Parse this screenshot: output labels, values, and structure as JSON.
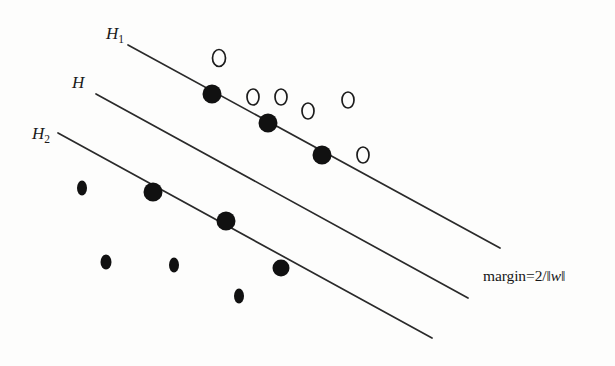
{
  "figure": {
    "background_color": "#fdfdfc",
    "ink_color": "#1a1a1a",
    "width": 615,
    "height": 366
  },
  "labels": {
    "h1": {
      "base": "H",
      "sub": "1"
    },
    "h": {
      "base": "H",
      "sub": ""
    },
    "h2": {
      "base": "H",
      "sub": "2"
    },
    "margin": {
      "prefix": "margin=2/‖",
      "variable": "w",
      "suffix": "‖",
      "full_text": "margin=2/‖w‖"
    }
  },
  "chart_data": {
    "type": "scatter",
    "xlabel": "",
    "ylabel": "",
    "xlim": [
      0,
      615
    ],
    "ylim": [
      366,
      0
    ],
    "grid": false,
    "legend": "none",
    "annotations": [
      {
        "name": "h1-label",
        "text": "H1",
        "x": 108,
        "y": 36
      },
      {
        "name": "h-label",
        "text": "H",
        "x": 74,
        "y": 85
      },
      {
        "name": "h2-label",
        "text": "H2",
        "x": 34,
        "y": 136
      },
      {
        "name": "margin-label",
        "text": "margin=2/||w||",
        "x": 483,
        "y": 281
      }
    ],
    "lines": [
      {
        "name": "H1",
        "label": "H1",
        "x1": 128,
        "y1": 45,
        "x2": 500,
        "y2": 248
      },
      {
        "name": "H",
        "label": "H",
        "x1": 96,
        "y1": 94,
        "x2": 468,
        "y2": 298
      },
      {
        "name": "H2",
        "label": "H2",
        "x1": 58,
        "y1": 133,
        "x2": 432,
        "y2": 338
      }
    ],
    "series": [
      {
        "name": "positive-class",
        "marker": "open-circle",
        "points": [
          {
            "x": 219,
            "y": 58,
            "rx": 6.5,
            "ry": 8.5
          },
          {
            "x": 253,
            "y": 97,
            "rx": 6.0,
            "ry": 8.0
          },
          {
            "x": 281,
            "y": 97,
            "rx": 6.0,
            "ry": 8.0
          },
          {
            "x": 308,
            "y": 111,
            "rx": 6.0,
            "ry": 8.0
          },
          {
            "x": 348,
            "y": 100,
            "rx": 6.0,
            "ry": 8.0
          },
          {
            "x": 363,
            "y": 155,
            "rx": 6.0,
            "ry": 8.0
          }
        ]
      },
      {
        "name": "negative-class",
        "marker": "filled-circle",
        "points": [
          {
            "x": 212,
            "y": 94,
            "rx": 9.5,
            "ry": 9.5,
            "support": true
          },
          {
            "x": 268,
            "y": 123,
            "rx": 9.5,
            "ry": 9.5,
            "support": true
          },
          {
            "x": 322,
            "y": 155,
            "rx": 9.5,
            "ry": 9.5,
            "support": true
          },
          {
            "x": 82,
            "y": 188,
            "rx": 5.0,
            "ry": 7.5,
            "support": false
          },
          {
            "x": 153,
            "y": 192,
            "rx": 9.5,
            "ry": 9.5,
            "support": true
          },
          {
            "x": 226,
            "y": 221,
            "rx": 9.5,
            "ry": 9.5,
            "support": true
          },
          {
            "x": 106,
            "y": 262,
            "rx": 5.5,
            "ry": 7.5,
            "support": false
          },
          {
            "x": 174,
            "y": 265,
            "rx": 5.0,
            "ry": 7.5,
            "support": false
          },
          {
            "x": 281,
            "y": 268,
            "rx": 8.5,
            "ry": 8.5,
            "support": false
          },
          {
            "x": 239,
            "y": 296,
            "rx": 5.0,
            "ry": 7.5,
            "support": false
          }
        ]
      }
    ]
  }
}
